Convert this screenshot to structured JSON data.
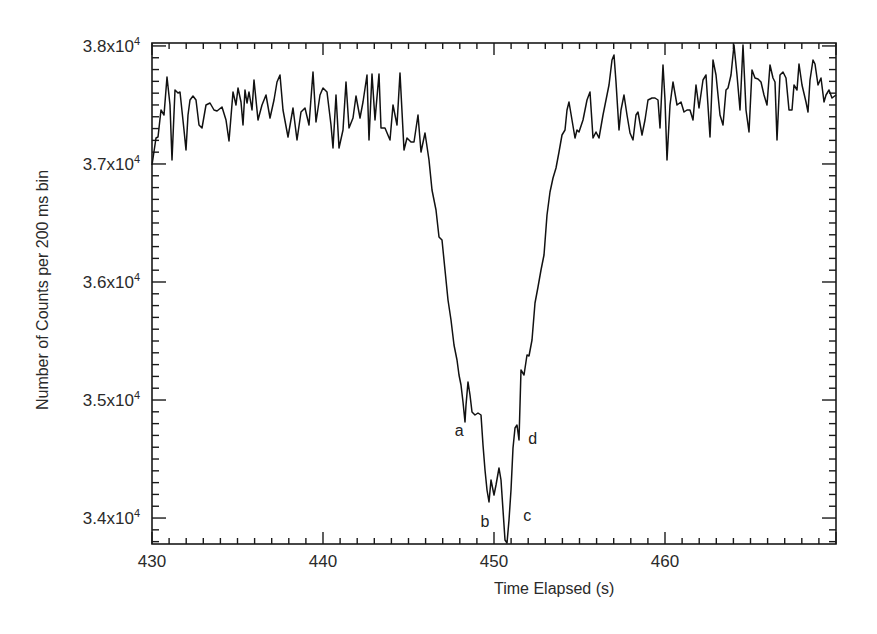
{
  "chart_data": {
    "type": "line",
    "title": "",
    "xlabel": "Time Elapsed (s)",
    "ylabel": "Number of Counts per 200 ms bin",
    "xlim": [
      430,
      470
    ],
    "ylim": [
      33780,
      38025
    ],
    "grid": false,
    "legend": null,
    "xticks": [
      430,
      440,
      450,
      460
    ],
    "xtick_labels": [
      "430",
      "440",
      "450",
      "460"
    ],
    "yticks": [
      34000,
      35000,
      36000,
      37000,
      38000
    ],
    "ytick_labels": [
      {
        "mantissa": "3.4x10",
        "exp": "4"
      },
      {
        "mantissa": "3.5x10",
        "exp": "4"
      },
      {
        "mantissa": "3.6x10",
        "exp": "4"
      },
      {
        "mantissa": "3.7x10",
        "exp": "4"
      },
      {
        "mantissa": "3.8x10",
        "exp": "4"
      }
    ],
    "annotations": [
      {
        "text": "a",
        "x": 448.0,
        "y": 34730
      },
      {
        "text": "b",
        "x": 449.5,
        "y": 33960
      },
      {
        "text": "c",
        "x": 452.0,
        "y": 34010
      },
      {
        "text": "d",
        "x": 452.3,
        "y": 34660
      }
    ],
    "series": [
      {
        "name": "counts",
        "color": "#111111",
        "points_px": [
          [
            152,
            165
          ],
          [
            156,
            138
          ],
          [
            158,
            137
          ],
          [
            161,
            110
          ],
          [
            164,
            115
          ],
          [
            167,
            77
          ],
          [
            170,
            105
          ],
          [
            172,
            160
          ],
          [
            175,
            90
          ],
          [
            178,
            93
          ],
          [
            180,
            92
          ],
          [
            184,
            130
          ],
          [
            186,
            150
          ],
          [
            188,
            115
          ],
          [
            190,
            100
          ],
          [
            193,
            96
          ],
          [
            196,
            100
          ],
          [
            199,
            125
          ],
          [
            202,
            128
          ],
          [
            206,
            105
          ],
          [
            210,
            103
          ],
          [
            214,
            110
          ],
          [
            217,
            111
          ],
          [
            222,
            107
          ],
          [
            226,
            120
          ],
          [
            229,
            141
          ],
          [
            233,
            92
          ],
          [
            236,
            105
          ],
          [
            238,
            88
          ],
          [
            241,
            102
          ],
          [
            243,
            125
          ],
          [
            245,
            90
          ],
          [
            247,
            103
          ],
          [
            249,
            92
          ],
          [
            252,
            110
          ],
          [
            254,
            80
          ],
          [
            258,
            120
          ],
          [
            262,
            105
          ],
          [
            266,
            95
          ],
          [
            270,
            118
          ],
          [
            274,
            100
          ],
          [
            277,
            82
          ],
          [
            280,
            75
          ],
          [
            283,
            110
          ],
          [
            288,
            137
          ],
          [
            293,
            108
          ],
          [
            297,
            140
          ],
          [
            301,
            112
          ],
          [
            305,
            108
          ],
          [
            309,
            125
          ],
          [
            313,
            72
          ],
          [
            316,
            122
          ],
          [
            320,
            95
          ],
          [
            323,
            88
          ],
          [
            327,
            92
          ],
          [
            331,
            125
          ],
          [
            333,
            148
          ],
          [
            336,
            95
          ],
          [
            339,
            148
          ],
          [
            343,
            130
          ],
          [
            346,
            82
          ],
          [
            349,
            128
          ],
          [
            353,
            118
          ],
          [
            356,
            96
          ],
          [
            360,
            118
          ],
          [
            363,
            102
          ],
          [
            367,
            75
          ],
          [
            369,
            140
          ],
          [
            372,
            74
          ],
          [
            375,
            120
          ],
          [
            379,
            74
          ],
          [
            381,
            128
          ],
          [
            385,
            128
          ],
          [
            390,
            140
          ],
          [
            393,
            105
          ],
          [
            397,
            125
          ],
          [
            400,
            73
          ],
          [
            404,
            150
          ],
          [
            407,
            138
          ],
          [
            411,
            142
          ],
          [
            414,
            142
          ],
          [
            418,
            115
          ],
          [
            421,
            152
          ],
          [
            425,
            133
          ],
          [
            429,
            160
          ],
          [
            432,
            190
          ],
          [
            436,
            210
          ],
          [
            439,
            237
          ],
          [
            442,
            240
          ],
          [
            445,
            270
          ],
          [
            448,
            300
          ],
          [
            451,
            320
          ],
          [
            454,
            345
          ],
          [
            457,
            360
          ],
          [
            459,
            375
          ],
          [
            461,
            385
          ],
          [
            463,
            402
          ],
          [
            465,
            422
          ],
          [
            466,
            405
          ],
          [
            468,
            382
          ],
          [
            470,
            395
          ],
          [
            472,
            412
          ],
          [
            475,
            415
          ],
          [
            478,
            413
          ],
          [
            481,
            415
          ],
          [
            483,
            445
          ],
          [
            485,
            470
          ],
          [
            487,
            490
          ],
          [
            489,
            502
          ],
          [
            491,
            480
          ],
          [
            494,
            495
          ],
          [
            496,
            485
          ],
          [
            499,
            468
          ],
          [
            501,
            480
          ],
          [
            503,
            510
          ],
          [
            505,
            540
          ],
          [
            507,
            543
          ],
          [
            509,
            520
          ],
          [
            511,
            490
          ],
          [
            513,
            448
          ],
          [
            515,
            428
          ],
          [
            517,
            425
          ],
          [
            519,
            440
          ],
          [
            521,
            370
          ],
          [
            524,
            375
          ],
          [
            527,
            355
          ],
          [
            529,
            356
          ],
          [
            532,
            340
          ],
          [
            535,
            303
          ],
          [
            538,
            287
          ],
          [
            541,
            270
          ],
          [
            544,
            255
          ],
          [
            547,
            215
          ],
          [
            550,
            192
          ],
          [
            553,
            178
          ],
          [
            556,
            168
          ],
          [
            559,
            152
          ],
          [
            562,
            135
          ],
          [
            565,
            130
          ],
          [
            567,
            110
          ],
          [
            569,
            102
          ],
          [
            572,
            120
          ],
          [
            575,
            138
          ],
          [
            577,
            130
          ],
          [
            579,
            132
          ],
          [
            583,
            120
          ],
          [
            587,
            100
          ],
          [
            590,
            92
          ],
          [
            593,
            138
          ],
          [
            596,
            132
          ],
          [
            599,
            138
          ],
          [
            603,
            115
          ],
          [
            606,
            100
          ],
          [
            609,
            85
          ],
          [
            612,
            60
          ],
          [
            614,
            55
          ],
          [
            616,
            82
          ],
          [
            619,
            130
          ],
          [
            621,
            110
          ],
          [
            624,
            95
          ],
          [
            627,
            115
          ],
          [
            630,
            133
          ],
          [
            633,
            140
          ],
          [
            636,
            115
          ],
          [
            638,
            112
          ],
          [
            642,
            135
          ],
          [
            645,
            120
          ],
          [
            648,
            100
          ],
          [
            652,
            98
          ],
          [
            655,
            98
          ],
          [
            658,
            100
          ],
          [
            660,
            128
          ],
          [
            663,
            65
          ],
          [
            665,
            100
          ],
          [
            667,
            160
          ],
          [
            670,
            105
          ],
          [
            673,
            82
          ],
          [
            677,
            105
          ],
          [
            681,
            102
          ],
          [
            684,
            112
          ],
          [
            687,
            110
          ],
          [
            690,
            110
          ],
          [
            693,
            120
          ],
          [
            696,
            85
          ],
          [
            699,
            108
          ],
          [
            703,
            80
          ],
          [
            706,
            75
          ],
          [
            710,
            137
          ],
          [
            713,
            60
          ],
          [
            716,
            75
          ],
          [
            720,
            115
          ],
          [
            723,
            125
          ],
          [
            726,
            90
          ],
          [
            728,
            88
          ],
          [
            731,
            75
          ],
          [
            734,
            45
          ],
          [
            737,
            75
          ],
          [
            740,
            110
          ],
          [
            743,
            45
          ],
          [
            746,
            110
          ],
          [
            749,
            132
          ],
          [
            752,
            70
          ],
          [
            755,
            78
          ],
          [
            758,
            79
          ],
          [
            761,
            82
          ],
          [
            764,
            95
          ],
          [
            767,
            105
          ],
          [
            770,
            65
          ],
          [
            773,
            78
          ],
          [
            775,
            82
          ],
          [
            777,
            140
          ],
          [
            780,
            75
          ],
          [
            783,
            72
          ],
          [
            786,
            78
          ],
          [
            789,
            110
          ],
          [
            792,
            110
          ],
          [
            794,
            85
          ],
          [
            797,
            90
          ],
          [
            799,
            64
          ],
          [
            802,
            85
          ],
          [
            806,
            102
          ],
          [
            808,
            112
          ],
          [
            810,
            80
          ],
          [
            813,
            60
          ],
          [
            815,
            64
          ],
          [
            818,
            85
          ],
          [
            821,
            78
          ],
          [
            824,
            102
          ],
          [
            826,
            95
          ],
          [
            829,
            90
          ],
          [
            832,
            98
          ],
          [
            836,
            95
          ]
        ]
      }
    ]
  },
  "plot_area": {
    "left": 152,
    "top": 43,
    "right": 836,
    "bottom": 544
  }
}
